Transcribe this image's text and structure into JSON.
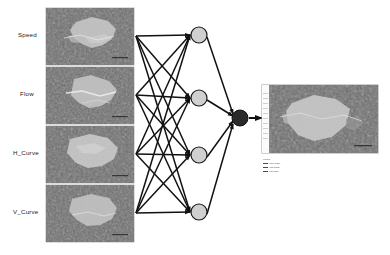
{
  "figure": {
    "type": "neural-network-diagram",
    "background_color": "#ffffff"
  },
  "inputs": {
    "labels": [
      {
        "text": "Speed",
        "name": "input-label-speed"
      },
      {
        "text": "Flow",
        "name": "input-label-flow"
      },
      {
        "text": "H_Curve",
        "name": "input-label-h-curve"
      },
      {
        "text": "V_Curve",
        "name": "input-label-v-curve"
      }
    ],
    "image_alt": "grayscale satellite raster",
    "panel_count": 4
  },
  "network": {
    "input_node_count": 4,
    "hidden_node_count": 4,
    "output_node_count": 1,
    "hidden_node_color": "#d0d0d0",
    "hidden_node_stroke": "#1a1a1a",
    "output_node_color": "#2a2a2a",
    "edge_color": "#111111",
    "fully_connected": true
  },
  "output": {
    "image_alt": "grayscale classified output raster map",
    "legend_strip": true,
    "caption_lines": [
      "Legend",
      "Value  Class",
      "High   Urban",
      "Low    Rural"
    ]
  }
}
